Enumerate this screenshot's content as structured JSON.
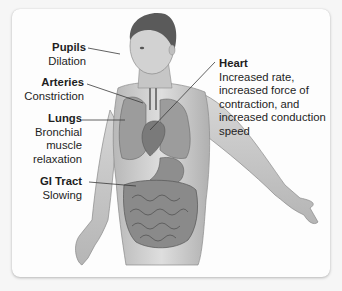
{
  "diagram": {
    "labels": [
      {
        "id": "pupils",
        "title": "Pupils",
        "description": "Dilation"
      },
      {
        "id": "arteries",
        "title": "Arteries",
        "description": "Constriction"
      },
      {
        "id": "lungs",
        "title": "Lungs",
        "description": "Bronchial\nmuscle\nrelaxation"
      },
      {
        "id": "gi-tract",
        "title": "GI Tract",
        "description": "Slowing"
      },
      {
        "id": "heart",
        "title": "Heart",
        "description": "Increased rate,\nincreased force of\ncontraction, and\nincreased conduction\nspeed"
      }
    ]
  },
  "colors": {
    "background": "#f6f6f6",
    "panel": "#fdfdfd",
    "text": "#1e1e1e",
    "skin": "#c9c9c9",
    "organ": "#8e8e8e",
    "hair": "#5a5a5a"
  }
}
